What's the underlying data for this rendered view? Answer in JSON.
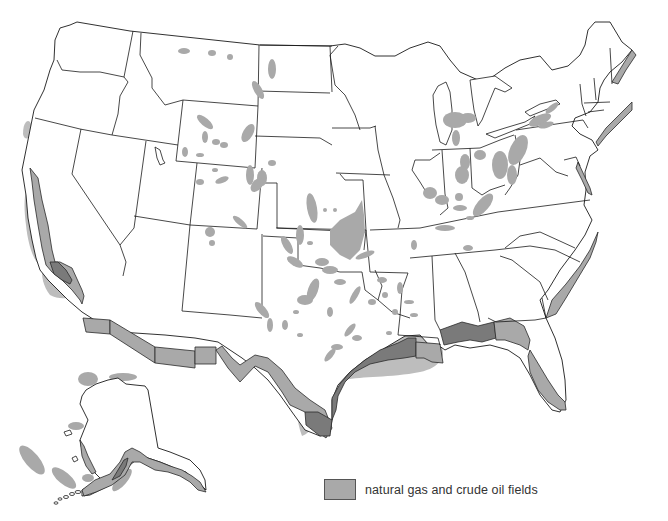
{
  "map": {
    "title": "",
    "subject": "United States natural gas and crude oil fields",
    "regions_shown": [
      "Contiguous United States",
      "Alaska"
    ],
    "colors": {
      "land": "#ffffff",
      "borders": "#1a1a1a",
      "fields": "#a9a9a9",
      "offshore_fields_dark": "#7a7a7a",
      "offshore_halo": "#bdbdbd"
    }
  },
  "legend": {
    "items": [
      {
        "label": "natural gas and crude oil fields",
        "color": "#a9a9a9"
      }
    ]
  }
}
